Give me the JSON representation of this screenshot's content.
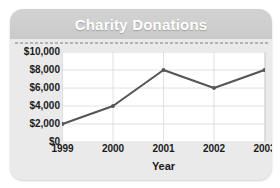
{
  "chart_data": {
    "type": "line",
    "title": "Charity Donations",
    "xlabel": "Year",
    "ylabel": "",
    "categories": [
      "1999",
      "2000",
      "2001",
      "2002",
      "2003"
    ],
    "values": [
      2000,
      4000,
      8000,
      6000,
      8000
    ],
    "ylim": [
      0,
      10000
    ],
    "ytick_labels": [
      "$10,000",
      "$8,000",
      "$6,000",
      "$4,000",
      "$2,000",
      "$0"
    ],
    "ytick_values": [
      10000,
      8000,
      6000,
      4000,
      2000,
      0
    ],
    "grid": true,
    "legend": "none",
    "series_color": "#555555",
    "title_color": "#ffffff",
    "title_band_color": "#cfcfcf",
    "plot_background": "#ffffff",
    "card_background": "#eaeaea",
    "gridline_color": "#d8d8d8"
  }
}
